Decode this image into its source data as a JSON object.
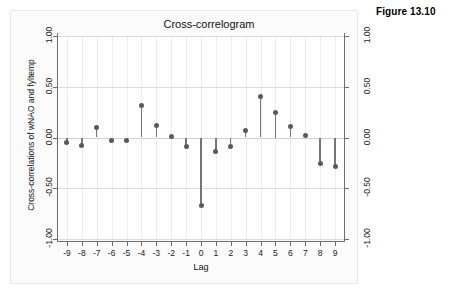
{
  "figure": {
    "caption": "Figure 13.10"
  },
  "chart_data": {
    "type": "scatter",
    "title": "Cross-correlogram",
    "xlabel": "Lag",
    "ylabel": "Cross-correlations of wNAO and fyltemp",
    "xlim": [
      -9.6,
      9.6
    ],
    "ylim": [
      -1.0,
      1.0
    ],
    "grid": true,
    "legend": "none",
    "marker_color": "#5a5a5a",
    "stem_color": "#767676",
    "baseline": 0.0,
    "x_tick_labels": [
      "-9",
      "-8",
      "-7",
      "-6",
      "-5",
      "-4",
      "-3",
      "-2",
      "-1",
      "0",
      "1",
      "2",
      "3",
      "4",
      "5",
      "6",
      "7",
      "8",
      "9"
    ],
    "y_tick_labels": [
      "1.00",
      "0.50",
      "0.00",
      "-0.50",
      "-1.00"
    ],
    "y_tick_values": [
      1.0,
      0.5,
      0.0,
      -0.5,
      -1.0
    ],
    "categories": [
      -9,
      -8,
      -7,
      -6,
      -5,
      -4,
      -3,
      -2,
      -1,
      0,
      1,
      2,
      3,
      4,
      5,
      6,
      7,
      8,
      9
    ],
    "values": [
      -0.05,
      -0.08,
      0.1,
      -0.03,
      -0.03,
      0.32,
      0.12,
      0.01,
      -0.09,
      -0.67,
      -0.14,
      -0.09,
      0.07,
      0.4,
      0.25,
      0.11,
      0.02,
      -0.26,
      -0.29
    ]
  }
}
